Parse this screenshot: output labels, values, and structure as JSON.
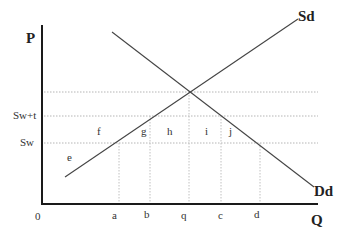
{
  "diagram": {
    "type": "supply-demand-tariff",
    "axes": {
      "y_label": "P",
      "x_label": "Q",
      "origin_label": "0"
    },
    "price_levels": [
      {
        "id": "sw_t",
        "label": "Sw+t"
      },
      {
        "id": "sw",
        "label": "Sw"
      }
    ],
    "quantity_ticks": [
      {
        "id": "a",
        "label": "a"
      },
      {
        "id": "b",
        "label": "b"
      },
      {
        "id": "q",
        "label": "q"
      },
      {
        "id": "c",
        "label": "c"
      },
      {
        "id": "d",
        "label": "d"
      }
    ],
    "curves": {
      "supply": {
        "label": "Sd"
      },
      "demand": {
        "label": "Dd"
      }
    },
    "regions": [
      {
        "id": "e",
        "label": "e"
      },
      {
        "id": "f",
        "label": "f"
      },
      {
        "id": "g",
        "label": "g"
      },
      {
        "id": "h",
        "label": "h"
      },
      {
        "id": "i",
        "label": "i"
      },
      {
        "id": "j",
        "label": "j"
      }
    ],
    "colors": {
      "axis": "#1a1a1a",
      "curve": "#444444",
      "guide": "#b0b0b0",
      "text": "#333333"
    }
  }
}
